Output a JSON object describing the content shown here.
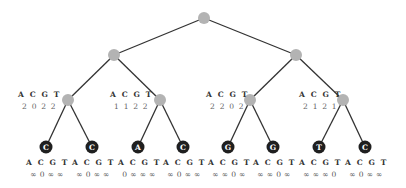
{
  "diagram": {
    "type": "tree",
    "colors": {
      "edge": "#333333",
      "internal_node": "#b3b3b3",
      "leaf_node": "#1f1f1f",
      "leaf_text": "#ffffff"
    },
    "header": "A C G T",
    "nodes": [
      {
        "id": "root",
        "x": 204,
        "y": 18,
        "kind": "internal"
      },
      {
        "id": "n1L",
        "x": 114,
        "y": 55,
        "kind": "internal"
      },
      {
        "id": "n1R",
        "x": 296,
        "y": 55,
        "kind": "internal"
      },
      {
        "id": "n2a",
        "x": 68,
        "y": 100,
        "kind": "internal",
        "label": {
          "header": "A C G T",
          "values": "2 0 2 2"
        }
      },
      {
        "id": "n2b",
        "x": 160,
        "y": 100,
        "kind": "internal",
        "label": {
          "header": "A C G T",
          "values": "1 1 2 2"
        }
      },
      {
        "id": "n2c",
        "x": 250,
        "y": 100,
        "kind": "internal",
        "label": {
          "header": "A C G T",
          "values": "2 2 0 2"
        }
      },
      {
        "id": "n2d",
        "x": 343,
        "y": 100,
        "kind": "internal",
        "label": {
          "header": "A C G T",
          "values": "2 1 2 1"
        }
      },
      {
        "id": "l1",
        "x": 46,
        "y": 147,
        "kind": "leaf",
        "base": "C",
        "label": {
          "header": "A C G T",
          "values": "∞ 0 ∞ ∞"
        }
      },
      {
        "id": "l2",
        "x": 92,
        "y": 147,
        "kind": "leaf",
        "base": "C",
        "label": {
          "header": "A C G T",
          "values": "∞ 0 ∞ ∞"
        }
      },
      {
        "id": "l3",
        "x": 138,
        "y": 147,
        "kind": "leaf",
        "base": "A",
        "label": {
          "header": "A C G T",
          "values": "0 ∞ ∞ ∞"
        }
      },
      {
        "id": "l4",
        "x": 183,
        "y": 147,
        "kind": "leaf",
        "base": "C",
        "label": {
          "header": "A C G T",
          "values": "∞ 0 ∞ ∞"
        }
      },
      {
        "id": "l5",
        "x": 228,
        "y": 147,
        "kind": "leaf",
        "base": "G",
        "label": {
          "header": "A C G T",
          "values": "∞ ∞ 0 ∞"
        }
      },
      {
        "id": "l6",
        "x": 273,
        "y": 147,
        "kind": "leaf",
        "base": "G",
        "label": {
          "header": "A C G T",
          "values": "∞ ∞ 0 ∞"
        }
      },
      {
        "id": "l7",
        "x": 319,
        "y": 147,
        "kind": "leaf",
        "base": "T",
        "label": {
          "header": "A C G T",
          "values": "∞ ∞ ∞ 0"
        }
      },
      {
        "id": "l8",
        "x": 365,
        "y": 147,
        "kind": "leaf",
        "base": "C",
        "label": {
          "header": "A C G T",
          "values": "∞ 0 ∞ ∞"
        }
      }
    ],
    "edges": [
      [
        "root",
        "n1L"
      ],
      [
        "root",
        "n1R"
      ],
      [
        "n1L",
        "n2a"
      ],
      [
        "n1L",
        "n2b"
      ],
      [
        "n1R",
        "n2c"
      ],
      [
        "n1R",
        "n2d"
      ],
      [
        "n2a",
        "l1"
      ],
      [
        "n2a",
        "l2"
      ],
      [
        "n2b",
        "l3"
      ],
      [
        "n2b",
        "l4"
      ],
      [
        "n2c",
        "l5"
      ],
      [
        "n2c",
        "l6"
      ],
      [
        "n2d",
        "l7"
      ],
      [
        "n2d",
        "l8"
      ]
    ],
    "internal_labels": {
      "n2a": {
        "header": "A C G T",
        "values": "2 0 2 2"
      },
      "n2b": {
        "header": "A C G T",
        "values": "1 1 2 2"
      },
      "n2c": {
        "header": "A C G T",
        "values": "2 2 0 2"
      },
      "n2d": {
        "header": "A C G T",
        "values": "2 1 2 1"
      }
    },
    "leaves": [
      {
        "base": "C",
        "header": "A C G T",
        "values": "∞ 0 ∞ ∞"
      },
      {
        "base": "C",
        "header": "A C G T",
        "values": "∞ 0 ∞ ∞"
      },
      {
        "base": "A",
        "header": "A C G T",
        "values": "0 ∞ ∞ ∞"
      },
      {
        "base": "C",
        "header": "A C G T",
        "values": "∞ 0 ∞ ∞"
      },
      {
        "base": "G",
        "header": "A C G T",
        "values": "∞ ∞ 0 ∞"
      },
      {
        "base": "G",
        "header": "A C G T",
        "values": "∞ ∞ 0 ∞"
      },
      {
        "base": "T",
        "header": "A C G T",
        "values": "∞ ∞ ∞ 0"
      },
      {
        "base": "C",
        "header": "A C G T",
        "values": "∞ 0 ∞ ∞"
      }
    ]
  }
}
